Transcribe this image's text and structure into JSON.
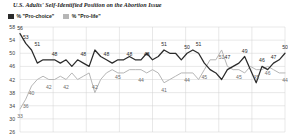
{
  "chart_data": {
    "type": "line",
    "title": "U.S. Adults' Self-Identified Position on the Abortion Issue",
    "xlabel": "",
    "ylabel": "",
    "ylim": [
      26,
      58
    ],
    "yticks": [
      58,
      54,
      50,
      46,
      42,
      38,
      34,
      30,
      26
    ],
    "grid": true,
    "xticklabels": [],
    "legend_position": "top-left",
    "colors": {
      "pro_choice": "#2b2b2b",
      "pro_life": "#b6b6b6"
    },
    "series": [
      {
        "name": "% \"Pro-choice\"",
        "color": "#2b2b2b",
        "values": [
          56,
          53,
          51,
          47,
          48,
          48,
          48,
          47,
          48,
          46,
          48,
          47,
          46,
          51,
          49,
          48,
          47,
          48,
          48,
          49,
          48,
          48,
          50,
          48,
          49,
          51,
          50,
          50,
          48,
          50,
          51,
          50,
          47,
          45,
          44,
          42,
          45,
          46,
          47,
          49,
          45,
          41,
          46,
          45,
          47,
          48,
          50
        ],
        "labels": [
          {
            "index": 0,
            "value": 56
          },
          {
            "index": 1,
            "value": 53
          },
          {
            "index": 3,
            "value": 51
          },
          {
            "index": 6,
            "value": 48
          },
          {
            "index": 11,
            "value": 48
          },
          {
            "index": 15,
            "value": 48
          },
          {
            "index": 19,
            "value": 48
          },
          {
            "index": 22,
            "value": 48
          },
          {
            "index": 25,
            "value": 51
          },
          {
            "index": 29,
            "value": 50
          },
          {
            "index": 31,
            "value": 51
          },
          {
            "index": 36,
            "value": 47
          },
          {
            "index": 39,
            "value": 49
          },
          {
            "index": 42,
            "value": 46
          },
          {
            "index": 44,
            "value": 47
          },
          {
            "index": 46,
            "value": 50
          }
        ]
      },
      {
        "name": "% \"Pro-life\"",
        "color": "#b6b6b6",
        "values": [
          33,
          36,
          40,
          42,
          43,
          42,
          42,
          43,
          42,
          44,
          42,
          43,
          44,
          38,
          42,
          44,
          45,
          44,
          44,
          45,
          45,
          45,
          44,
          45,
          44,
          41,
          42,
          43,
          44,
          44,
          44,
          42,
          45,
          48,
          48,
          51,
          46,
          45,
          45,
          44,
          46,
          45,
          45,
          46,
          45,
          44,
          44
        ],
        "labels": [
          {
            "index": 0,
            "value": 33
          },
          {
            "index": 1,
            "value": 36
          },
          {
            "index": 2,
            "value": 40
          },
          {
            "index": 5,
            "value": 42
          },
          {
            "index": 8,
            "value": 42
          },
          {
            "index": 13,
            "value": 42
          },
          {
            "index": 17,
            "value": 45
          },
          {
            "index": 21,
            "value": 44
          },
          {
            "index": 25,
            "value": 41
          },
          {
            "index": 29,
            "value": 44
          },
          {
            "index": 32,
            "value": 45
          },
          {
            "index": 35,
            "value": 51
          },
          {
            "index": 38,
            "value": 45
          },
          {
            "index": 41,
            "value": 45
          },
          {
            "index": 43,
            "value": 46
          },
          {
            "index": 46,
            "value": 44
          }
        ]
      }
    ],
    "vertical_gridlines": 9
  }
}
